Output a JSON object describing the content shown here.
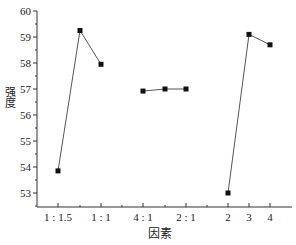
{
  "chart_data": {
    "type": "line",
    "title": "",
    "xlabel": "因素",
    "ylabel": "强度",
    "ylim": [
      52.5,
      60
    ],
    "yticks": [
      53,
      54,
      55,
      56,
      57,
      58,
      59,
      60
    ],
    "grid": false,
    "legend": null,
    "x_tick_labels": [
      "1 : 1.5",
      "1 : 1",
      "4 : 1",
      "2 : 1",
      "2",
      "3",
      "4"
    ],
    "series": [
      {
        "name": "group-1",
        "points": [
          {
            "x_label": "1 : 1.5",
            "y": 53.85
          },
          {
            "x_label": "",
            "y": 59.25
          },
          {
            "x_label": "1 : 1",
            "y": 57.95
          }
        ]
      },
      {
        "name": "group-2",
        "points": [
          {
            "x_label": "4 : 1",
            "y": 56.92
          },
          {
            "x_label": "",
            "y": 57.0
          },
          {
            "x_label": "2 : 1",
            "y": 57.0
          }
        ]
      },
      {
        "name": "group-3",
        "points": [
          {
            "x_label": "2",
            "y": 53.0
          },
          {
            "x_label": "3",
            "y": 59.1
          },
          {
            "x_label": "4",
            "y": 58.7
          }
        ]
      }
    ],
    "marker": "filled-square",
    "line_color": "#555555",
    "marker_color": "#111111"
  },
  "axes": {
    "x_title": "因素",
    "y_title": "强度"
  }
}
